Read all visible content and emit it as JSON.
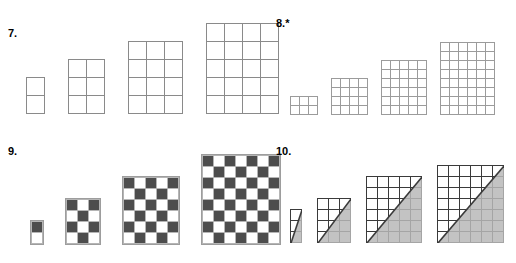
{
  "page": {
    "kind": "math-worksheet-figure-patterns",
    "background_color": "#ffffff",
    "problem_count": 4
  },
  "palette": {
    "ink": "#000000",
    "thin_grid_line": "#8a8a8a",
    "fine_grid_line": "#9b9b9b",
    "bold_grid_line": "#3a3a3a",
    "checker_dark": "#4d4d4d",
    "checker_light": "#ffffff",
    "shade_gray": "#b9b9b9"
  },
  "problems": [
    {
      "id": "problem-7",
      "number_label": "7.",
      "starred": false,
      "style": "outline",
      "cell_px": 18,
      "line_color": "#8a8a8a",
      "figures": [
        {
          "index": 1,
          "cols": 1,
          "rows": 2,
          "cells": 2
        },
        {
          "index": 2,
          "cols": 2,
          "rows": 3,
          "cells": 6
        },
        {
          "index": 3,
          "cols": 3,
          "rows": 4,
          "cells": 12
        },
        {
          "index": 4,
          "cols": 4,
          "rows": 5,
          "cells": 20
        }
      ]
    },
    {
      "id": "problem-8",
      "number_label": "8.",
      "starred": true,
      "star_glyph": "*",
      "style": "outline-fine",
      "cell_px": 9,
      "line_color": "#9b9b9b",
      "figures": [
        {
          "index": 1,
          "cols": 3,
          "rows": 2,
          "cells": 6
        },
        {
          "index": 2,
          "cols": 4,
          "rows": 4,
          "cells": 16
        },
        {
          "index": 3,
          "cols": 5,
          "rows": 6,
          "cells": 30
        },
        {
          "index": 4,
          "cols": 6,
          "rows": 8,
          "cells": 48
        }
      ]
    },
    {
      "id": "problem-9",
      "number_label": "9.",
      "starred": false,
      "style": "checkerboard",
      "cell_px": 10,
      "dark_color": "#4d4d4d",
      "light_color": "#ffffff",
      "top_left_is_dark": true,
      "figures": [
        {
          "index": 1,
          "cols": 1,
          "rows": 2,
          "cells": 2,
          "dark_cells": 1,
          "light_cells": 1
        },
        {
          "index": 2,
          "cols": 3,
          "rows": 4,
          "cells": 12,
          "dark_cells": 6,
          "light_cells": 6
        },
        {
          "index": 3,
          "cols": 5,
          "rows": 6,
          "cells": 30,
          "dark_cells": 15,
          "light_cells": 15
        },
        {
          "index": 4,
          "cols": 7,
          "rows": 8,
          "cells": 56,
          "dark_cells": 28,
          "light_cells": 28
        }
      ]
    },
    {
      "id": "problem-10",
      "number_label": "10.",
      "starred": false,
      "style": "diagonal-shaded",
      "cell_px": 11,
      "line_color": "#3a3a3a",
      "shade_color": "#b9b9b9",
      "diagonal_from": "bottom-left",
      "diagonal_to": "top-right",
      "shaded_region": "lower-right-triangle",
      "figures": [
        {
          "index": 1,
          "cols": 1,
          "rows": 3,
          "cells": 3
        },
        {
          "index": 2,
          "cols": 3,
          "rows": 4,
          "cells": 12
        },
        {
          "index": 3,
          "cols": 5,
          "rows": 6,
          "cells": 30
        },
        {
          "index": 4,
          "cols": 6,
          "rows": 7,
          "cells": 42
        }
      ]
    }
  ]
}
